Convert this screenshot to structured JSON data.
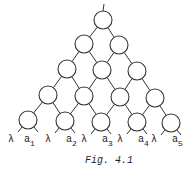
{
  "figure": {
    "caption": "Fig. 4.1",
    "colors": {
      "stroke": "#333333",
      "background": "#ffffff",
      "text": "#222222"
    },
    "rows": [
      [
        [
          103,
          20
        ]
      ],
      [
        [
          84,
          44
        ],
        [
          119,
          45
        ]
      ],
      [
        [
          67,
          69
        ],
        [
          102,
          70
        ],
        [
          137,
          71
        ]
      ],
      [
        [
          48,
          95
        ],
        [
          84,
          96
        ],
        [
          120,
          97
        ],
        [
          155,
          98
        ]
      ],
      [
        [
          28,
          120
        ],
        [
          65,
          121
        ],
        [
          101,
          122
        ],
        [
          137,
          122
        ],
        [
          171,
          123
        ]
      ]
    ],
    "node_radius": 9,
    "inputs": [
      {
        "lambda": "λ",
        "a": "a",
        "sub": "1"
      },
      {
        "lambda": "λ",
        "a": "a",
        "sub": "2"
      },
      {
        "lambda": "λ",
        "a": "a",
        "sub": "3"
      },
      {
        "lambda": "λ",
        "a": "a",
        "sub": "4"
      },
      {
        "lambda": "λ",
        "a": "a",
        "sub": "5"
      }
    ]
  }
}
